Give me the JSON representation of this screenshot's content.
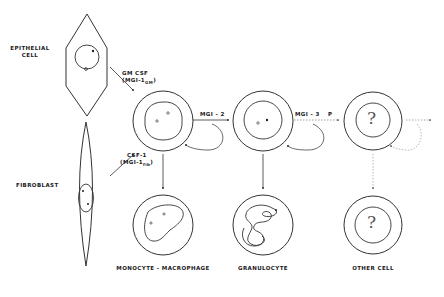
{
  "diagram": {
    "source_cells": {
      "epithelial": {
        "label_line1": "EPITHELIAL",
        "label_line2": "CELL"
      },
      "fibroblast": {
        "label": "FIBROBLAST"
      }
    },
    "inducers": {
      "gm_csf": {
        "line1": "GM  CSF",
        "line2_prefix": "(MGI-1",
        "line2_sub": "GM",
        "line2_suffix": ")"
      },
      "csf1": {
        "line1": "CSF-1",
        "line2_prefix": "(MGI-1",
        "line2_sub": "fib",
        "line2_suffix": ")"
      }
    },
    "steps": [
      {
        "label": "MGI - 2"
      },
      {
        "label": "MGI - 3"
      },
      {
        "label": "P"
      }
    ],
    "unknown_marker": "?",
    "outputs": [
      {
        "label": "MONOCYTE - MACROPHAGE"
      },
      {
        "label": "GRANULOCYTE"
      },
      {
        "label": "OTHER  CELL"
      }
    ],
    "colors": {
      "line": "#333333",
      "dotted": "#888888",
      "text": "#1a1a1a"
    }
  }
}
